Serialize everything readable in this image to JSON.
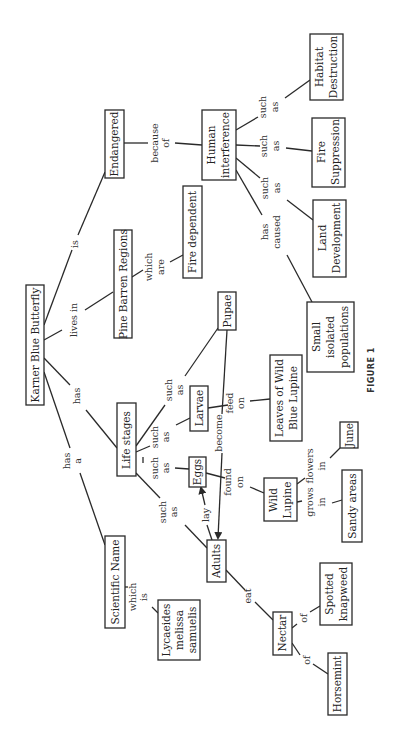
{
  "figure_label": "FIGURE 1",
  "colors": {
    "ink": "#2a2a2a",
    "background": "#ffffff"
  },
  "nodes": {
    "karner": [
      "Karner Blue Butterfly"
    ],
    "endangered": [
      "Endangered"
    ],
    "pine": [
      "Pine Barren Regions"
    ],
    "fire_dep": [
      "Fire dependent"
    ],
    "human": [
      "Human",
      "interference"
    ],
    "habitat": [
      "Habitat",
      "Destruction"
    ],
    "fire_sup": [
      "Fire",
      "Suppression"
    ],
    "land": [
      "Land",
      "Development"
    ],
    "small": [
      "Small",
      "isolated",
      "populations"
    ],
    "pupae": [
      "Pupae"
    ],
    "larvae": [
      "Larvae"
    ],
    "leaves": [
      "Leaves of Wild",
      "Blue Lupine"
    ],
    "life": [
      "Life stages"
    ],
    "eggs": [
      "Eggs"
    ],
    "wild": [
      "Wild",
      "Lupine"
    ],
    "june": [
      "June"
    ],
    "sandy": [
      "Sandy areas"
    ],
    "adults": [
      "Adults"
    ],
    "sci": [
      "Scientific Name"
    ],
    "lyc": [
      "Lycaeides",
      "melissa",
      "samuelis"
    ],
    "nectar": [
      "Nectar"
    ],
    "spotted": [
      "Spotted",
      "knapweed"
    ],
    "horsemint": [
      "Horsemint"
    ]
  },
  "links": {
    "is": [
      "is"
    ],
    "lives_in": [
      "lives in"
    ],
    "has": [
      "has"
    ],
    "has_a": [
      "has",
      "a"
    ],
    "because_of": [
      "because",
      "of"
    ],
    "which_are": [
      "which",
      "are"
    ],
    "such_as_hd": [
      "such",
      "as"
    ],
    "such_as_fs": [
      "such",
      "as"
    ],
    "such_as_ld": [
      "such",
      "as"
    ],
    "has_caused": [
      "has",
      "caused"
    ],
    "such_as_pupae": [
      "such",
      "as"
    ],
    "such_as_larvae": [
      "such",
      "as"
    ],
    "such_as_eggs": [
      "such",
      "as"
    ],
    "such_as_adults": [
      "such",
      "as"
    ],
    "feed_on": [
      "feed",
      "on"
    ],
    "become": [
      "become"
    ],
    "found_on": [
      "found",
      "on"
    ],
    "lay": [
      "lay"
    ],
    "grows_in": [
      "grows",
      "in"
    ],
    "flowers_in": [
      "flowers",
      "in"
    ],
    "which_is": [
      "which",
      "is"
    ],
    "eat": [
      "eat"
    ],
    "of_spotted": [
      "of"
    ],
    "of_horsemint": [
      "of"
    ]
  }
}
